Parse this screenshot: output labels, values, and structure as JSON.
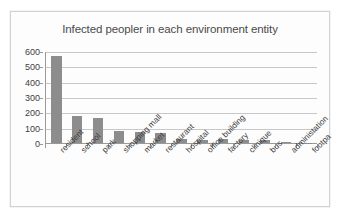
{
  "chart_data": {
    "type": "bar",
    "title": "Infected peopler in each environment entity",
    "xlabel": "",
    "ylabel": "",
    "ylim": [
      0,
      600
    ],
    "yticks": [
      0,
      100,
      200,
      300,
      400,
      500,
      600
    ],
    "grid": true,
    "legend": false,
    "bar_color": "#8d8d8d",
    "categories": [
      "resident",
      "school",
      "park",
      "shopping mall",
      "market",
      "restaurant",
      "hospital",
      "office building",
      "factory",
      "clinique",
      "bus",
      "administation",
      "footpa"
    ],
    "values": [
      570,
      178,
      163,
      80,
      75,
      67,
      28,
      20,
      27,
      17,
      18,
      4,
      2
    ]
  },
  "axis": {
    "y_tick_labels": [
      "600",
      "500",
      "400",
      "300",
      "200",
      "100",
      "0"
    ]
  }
}
